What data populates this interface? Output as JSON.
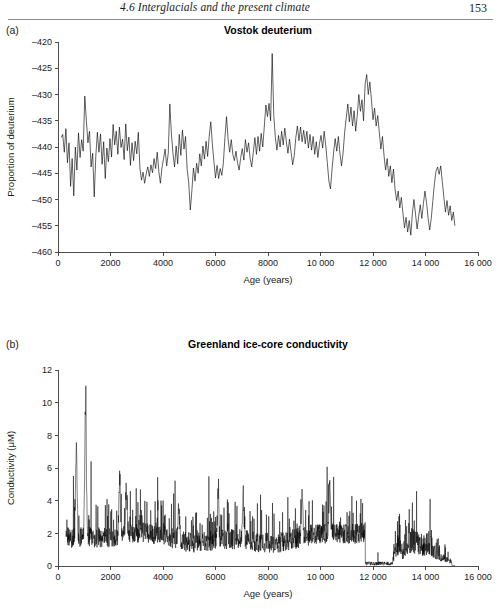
{
  "page": {
    "header_title": "4.6  Interglacials and the present climate",
    "folio": "153"
  },
  "figures": [
    {
      "letter": "(a)",
      "title": "Vostok deuterium",
      "x_axis_title": "Age (years)",
      "y_axis_title": "Proportion of deuterium",
      "x_tick_labels": [
        "0",
        "2000",
        "4000",
        "6000",
        "8000",
        "10 000",
        "12 000",
        "14 000",
        "16 000"
      ],
      "y_tick_labels": [
        "–420",
        "–425",
        "–430",
        "–435",
        "–440",
        "–445",
        "–450",
        "–455",
        "–460"
      ]
    },
    {
      "letter": "(b)",
      "title": "Greenland ice-core conductivity",
      "x_axis_title": "Age (years)",
      "y_axis_title": "Conductivity (μM)",
      "x_tick_labels": [
        "0",
        "2000",
        "4000",
        "6000",
        "8000",
        "10 000",
        "12 000",
        "14 000",
        "16 000"
      ],
      "y_tick_labels": [
        "12",
        "10",
        "8",
        "6",
        "4",
        "2",
        "0"
      ]
    }
  ],
  "chart_data": [
    {
      "type": "line",
      "panel": "a",
      "title": "Vostok deuterium",
      "xlabel": "Age (years)",
      "ylabel": "Proportion of deuterium",
      "xlim": [
        0,
        16000
      ],
      "ylim": [
        -460,
        -420
      ],
      "xticks": [
        0,
        2000,
        4000,
        6000,
        8000,
        10000,
        12000,
        14000,
        16000
      ],
      "yticks": [
        -460,
        -455,
        -450,
        -445,
        -440,
        -435,
        -430,
        -425,
        -420
      ],
      "grid": false,
      "legend": "none",
      "series": [
        {
          "name": "Vostok deuterium (‰)",
          "x": [
            120,
            180,
            240,
            300,
            360,
            420,
            480,
            540,
            600,
            660,
            720,
            780,
            840,
            900,
            960,
            1020,
            1080,
            1140,
            1200,
            1260,
            1320,
            1380,
            1440,
            1500,
            1560,
            1620,
            1680,
            1740,
            1800,
            1860,
            1920,
            1980,
            2040,
            2100,
            2160,
            2220,
            2280,
            2340,
            2400,
            2460,
            2520,
            2580,
            2640,
            2700,
            2760,
            2820,
            2880,
            2940,
            3000,
            3060,
            3120,
            3180,
            3240,
            3300,
            3360,
            3420,
            3480,
            3540,
            3600,
            3660,
            3720,
            3780,
            3840,
            3900,
            3960,
            4020,
            4080,
            4140,
            4200,
            4260,
            4320,
            4380,
            4440,
            4500,
            4560,
            4620,
            4680,
            4740,
            4800,
            4860,
            4920,
            4980,
            5040,
            5100,
            5160,
            5220,
            5280,
            5340,
            5400,
            5460,
            5520,
            5580,
            5640,
            5700,
            5760,
            5820,
            5880,
            5940,
            6000,
            6060,
            6120,
            6180,
            6240,
            6300,
            6360,
            6420,
            6480,
            6540,
            6600,
            6660,
            6720,
            6780,
            6840,
            6900,
            6960,
            7020,
            7080,
            7140,
            7200,
            7260,
            7320,
            7380,
            7440,
            7500,
            7560,
            7620,
            7680,
            7740,
            7800,
            7860,
            7920,
            7980,
            8040,
            8100,
            8160,
            8220,
            8280,
            8340,
            8400,
            8460,
            8520,
            8580,
            8640,
            8700,
            8760,
            8820,
            8880,
            8940,
            9000,
            9060,
            9120,
            9180,
            9240,
            9300,
            9360,
            9420,
            9480,
            9540,
            9600,
            9660,
            9720,
            9780,
            9840,
            9900,
            9960,
            10020,
            10080,
            10140,
            10200,
            10260,
            10320,
            10380,
            10440,
            10500,
            10560,
            10620,
            10680,
            10740,
            10800,
            10860,
            10920,
            10980,
            11040,
            11100,
            11160,
            11220,
            11280,
            11340,
            11400,
            11460,
            11520,
            11580,
            11640,
            11700,
            11760,
            11820,
            11880,
            11940,
            12000,
            12060,
            12120,
            12180,
            12240,
            12300,
            12360,
            12420,
            12480,
            12540,
            12600,
            12660,
            12720,
            12780,
            12840,
            12900,
            12960,
            13020,
            13080,
            13140,
            13200,
            13260,
            13320,
            13380,
            13440,
            13500,
            13560,
            13620,
            13680,
            13740,
            13800,
            13860,
            13920,
            13980,
            14040,
            14100,
            14160,
            14220,
            14280,
            14340,
            14400,
            14460,
            14520,
            14580,
            14640,
            14700,
            14760,
            14820,
            14880,
            14940,
            15000,
            15060,
            15120
          ],
          "y": [
            -438.2,
            -437.6,
            -441.0,
            -436.5,
            -443.0,
            -439.2,
            -447.5,
            -442.2,
            -449.3,
            -440.0,
            -444.4,
            -437.3,
            -442.0,
            -438.6,
            -440.8,
            -430.3,
            -434.9,
            -439.2,
            -437.0,
            -443.8,
            -441.2,
            -449.5,
            -441.8,
            -437.2,
            -441.0,
            -437.5,
            -443.3,
            -439.0,
            -446.0,
            -440.2,
            -442.8,
            -438.4,
            -441.9,
            -435.7,
            -439.6,
            -437.0,
            -441.4,
            -436.2,
            -440.1,
            -438.5,
            -442.4,
            -435.6,
            -440.7,
            -438.1,
            -443.5,
            -439.2,
            -442.6,
            -438.9,
            -441.3,
            -437.2,
            -444.0,
            -446.3,
            -444.8,
            -446.9,
            -445.1,
            -443.8,
            -445.6,
            -443.4,
            -444.9,
            -442.2,
            -444.1,
            -441.0,
            -444.6,
            -446.9,
            -444.0,
            -442.2,
            -440.4,
            -443.6,
            -441.2,
            -431.8,
            -437.5,
            -441.2,
            -443.8,
            -439.8,
            -443.2,
            -437.6,
            -441.6,
            -436.8,
            -440.4,
            -438.0,
            -444.2,
            -446.8,
            -452.0,
            -448.3,
            -444.0,
            -446.5,
            -443.1,
            -445.0,
            -441.3,
            -443.6,
            -439.8,
            -442.3,
            -438.9,
            -441.8,
            -438.0,
            -435.2,
            -439.4,
            -442.8,
            -445.9,
            -443.5,
            -446.0,
            -444.1,
            -445.4,
            -443.0,
            -438.2,
            -434.2,
            -438.5,
            -441.0,
            -438.6,
            -441.4,
            -442.6,
            -440.8,
            -443.0,
            -444.4,
            -442.0,
            -440.3,
            -442.5,
            -438.6,
            -441.0,
            -439.2,
            -442.2,
            -443.8,
            -441.0,
            -438.2,
            -441.4,
            -438.0,
            -440.8,
            -437.4,
            -440.0,
            -436.0,
            -432.0,
            -434.2,
            -431.7,
            -435.0,
            -422.2,
            -434.0,
            -438.2,
            -440.6,
            -437.8,
            -440.0,
            -437.0,
            -439.6,
            -436.4,
            -439.0,
            -441.2,
            -438.5,
            -441.0,
            -443.4,
            -441.6,
            -438.2,
            -436.0,
            -438.8,
            -436.2,
            -439.0,
            -436.8,
            -439.4,
            -437.0,
            -440.2,
            -437.6,
            -440.6,
            -438.0,
            -441.4,
            -439.0,
            -442.0,
            -439.4,
            -437.8,
            -440.2,
            -437.0,
            -439.8,
            -443.0,
            -446.5,
            -448.0,
            -444.2,
            -441.0,
            -438.4,
            -440.8,
            -438.0,
            -441.2,
            -443.6,
            -441.2,
            -437.2,
            -434.5,
            -431.8,
            -435.2,
            -432.4,
            -436.0,
            -433.1,
            -437.0,
            -434.0,
            -430.0,
            -433.2,
            -431.0,
            -435.0,
            -428.0,
            -426.2,
            -430.0,
            -427.6,
            -431.0,
            -434.8,
            -432.6,
            -436.0,
            -434.0,
            -437.2,
            -440.4,
            -438.0,
            -441.6,
            -444.4,
            -442.2,
            -445.6,
            -443.6,
            -446.8,
            -444.2,
            -448.0,
            -450.2,
            -448.4,
            -451.6,
            -449.6,
            -452.6,
            -455.4,
            -453.4,
            -456.2,
            -454.0,
            -456.8,
            -452.6,
            -450.0,
            -452.8,
            -455.6,
            -453.2,
            -451.0,
            -453.6,
            -450.8,
            -448.4,
            -450.6,
            -453.6,
            -455.8,
            -453.6,
            -450.2,
            -447.0,
            -444.6,
            -443.8,
            -445.2,
            -443.6,
            -446.6,
            -449.6,
            -452.4,
            -450.2,
            -453.0,
            -451.2,
            -454.0,
            -452.4,
            -455.0,
            -453.2,
            -456.0,
            -454.4,
            -457.0
          ]
        }
      ]
    },
    {
      "type": "line",
      "panel": "b",
      "title": "Greenland ice-core conductivity",
      "xlabel": "Age (years)",
      "ylabel": "Conductivity (μM)",
      "xlim": [
        0,
        16000
      ],
      "ylim": [
        0,
        12
      ],
      "xticks": [
        0,
        2000,
        4000,
        6000,
        8000,
        10000,
        12000,
        14000,
        16000
      ],
      "yticks": [
        0,
        2,
        4,
        6,
        8,
        10,
        12
      ],
      "grid": false,
      "legend": "none",
      "description": "Very dense high-frequency record. Baseline ~1.3-2.0 uM from 300-11700 years with frequent spikes to 3-5 and isolated maxima of 7.1 (approx 700 yr) and 9.8 (approx 1050 yr). Near-zero values between approx 11700 and 12750 years, then renewed spiky activity 12800-15000 with peaks to 4.3 (approx 12900), 5.6 (approx 13550) and 3.9 (approx 14100), tailing to near zero by 15100.",
      "baseline_mean": 1.7,
      "max_value": 9.8,
      "notable_peaks": [
        {
          "x": 700,
          "y": 7.1
        },
        {
          "x": 1050,
          "y": 9.8
        },
        {
          "x": 2350,
          "y": 5.0
        },
        {
          "x": 2600,
          "y": 4.6
        },
        {
          "x": 4600,
          "y": 3.6
        },
        {
          "x": 6100,
          "y": 4.4
        },
        {
          "x": 7050,
          "y": 4.2
        },
        {
          "x": 9300,
          "y": 4.2
        },
        {
          "x": 10350,
          "y": 4.4
        },
        {
          "x": 12900,
          "y": 4.3
        },
        {
          "x": 13550,
          "y": 5.6
        },
        {
          "x": 14100,
          "y": 3.9
        }
      ],
      "gap_range": [
        11700,
        12750
      ]
    }
  ]
}
